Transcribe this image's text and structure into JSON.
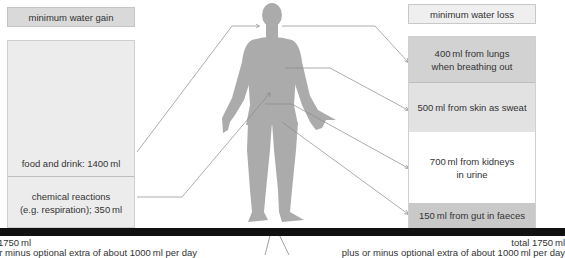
{
  "gain": {
    "header": "minimum water gain",
    "items": [
      {
        "label": "food and drink: 1400 ml",
        "amount_ml": 1400
      },
      {
        "label_line1": "chemical reactions",
        "label_line2": "(e.g. respiration); 350 ml",
        "amount_ml": 350
      }
    ],
    "total_line1": "1750 ml",
    "total_line2": "or minus optional extra of about 1000 ml per day"
  },
  "loss": {
    "header": "minimum water loss",
    "items": [
      {
        "label_line1": "400 ml from lungs",
        "label_line2": "when breathing out",
        "amount_ml": 400,
        "color": "#d2d2d2"
      },
      {
        "label_line1": "500 ml from skin as sweat",
        "label_line2": "",
        "amount_ml": 500,
        "color": "#e2e2e2"
      },
      {
        "label_line1": "700 ml from kidneys",
        "label_line2": "in urine",
        "amount_ml": 700,
        "color": "#ffffff"
      },
      {
        "label_line1": "150 ml from gut in faeces",
        "label_line2": "",
        "amount_ml": 150,
        "color": "#c9c9c9"
      }
    ],
    "total_line1": "total 1750 ml",
    "total_line2": "plus or minus optional extra of about 1000 ml per day"
  },
  "colors": {
    "figure": "#aaaaaa",
    "bar": "#111111",
    "lines": "#8a8a8a"
  }
}
